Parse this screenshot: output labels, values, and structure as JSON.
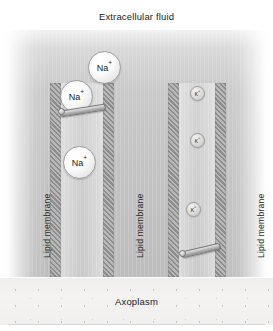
{
  "figure": {
    "type": "diagram",
    "width": 273,
    "height": 331
  },
  "regions": {
    "extracellular": {
      "label": "Extracellular fluid"
    },
    "axoplasm": {
      "label": "Axoplasm"
    }
  },
  "membrane_labels": [
    {
      "text": "Lipid membrane"
    },
    {
      "text": "Lipid membrane"
    },
    {
      "text": "Lipid membrane"
    }
  ],
  "channels": [
    {
      "name": "sodium-channel",
      "ion_symbol": "Na",
      "charge": "+",
      "state": "open",
      "gate": "open-flap"
    },
    {
      "name": "potassium-channel",
      "ion_symbol": "K",
      "charge": "+",
      "state": "open",
      "gate": "open-flap"
    }
  ],
  "ions": [
    {
      "name": "sodium-ion-outer",
      "symbol": "Na",
      "charge": "+",
      "size": "large"
    },
    {
      "name": "sodium-ion-gate",
      "symbol": "Na",
      "charge": "+",
      "size": "large"
    },
    {
      "name": "sodium-ion-inner",
      "symbol": "Na",
      "charge": "+",
      "size": "large"
    },
    {
      "name": "potassium-ion-upper",
      "symbol": "K",
      "charge": "+",
      "size": "small"
    },
    {
      "name": "potassium-ion-mid",
      "symbol": "K",
      "charge": "+",
      "size": "small"
    },
    {
      "name": "potassium-ion-lower",
      "symbol": "K",
      "charge": "+",
      "size": "small"
    }
  ],
  "colors": {
    "membrane_hatch_dark": "#8d8d8d",
    "membrane_hatch_light": "#b8b8b8",
    "field_top": "#f2f2f2",
    "field_bottom": "#bdbdbd",
    "axoplasm": "#f1f0ee",
    "text": "#1c1c1c"
  }
}
